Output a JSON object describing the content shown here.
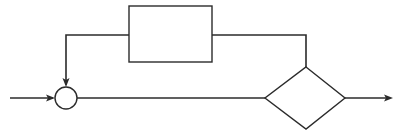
{
  "diagram": {
    "type": "block-diagram",
    "colors": {
      "stroke": "#2b2b2b",
      "background": "#ffffff"
    },
    "nodes": [
      {
        "id": "summing-junction",
        "shape": "circle",
        "cx": 66,
        "cy": 98,
        "r": 11,
        "label": ""
      },
      {
        "id": "feedback-block",
        "shape": "rectangle",
        "x": 129,
        "y": 6,
        "width": 83,
        "height": 56,
        "label": ""
      },
      {
        "id": "decision-block",
        "shape": "diamond",
        "points": [
          [
            306,
            67
          ],
          [
            345,
            98
          ],
          [
            306,
            129
          ],
          [
            265,
            98
          ]
        ],
        "label": ""
      }
    ],
    "edges": [
      {
        "id": "input-arrow",
        "from": "external-input",
        "to": "summing-junction",
        "arrow": true
      },
      {
        "id": "forward-path",
        "from": "summing-junction",
        "to": "decision-block",
        "arrow": false
      },
      {
        "id": "output-arrow",
        "from": "decision-block",
        "to": "external-output",
        "arrow": true
      },
      {
        "id": "feedback-to-block",
        "from": "decision-block",
        "to": "feedback-block",
        "arrow": false
      },
      {
        "id": "feedback-to-junction",
        "from": "feedback-block",
        "to": "summing-junction",
        "arrow": true
      }
    ]
  }
}
